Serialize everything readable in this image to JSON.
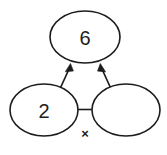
{
  "diagram": {
    "type": "number-bond-multiplication",
    "background_color": "#ffffff",
    "stroke_color": "#1c1c1c",
    "nodes": [
      {
        "id": "product",
        "role": "product",
        "label": "6",
        "filled": true
      },
      {
        "id": "factor-left",
        "role": "factor",
        "label": "2",
        "filled": true
      },
      {
        "id": "factor-right",
        "role": "factor",
        "label": "",
        "filled": false
      }
    ],
    "operator": {
      "symbol": "×",
      "name": "multiplication-sign"
    },
    "arrows": [
      {
        "id": "arrow-left",
        "from": "factor-left",
        "to": "product"
      },
      {
        "id": "arrow-right",
        "from": "factor-right",
        "to": "product"
      }
    ]
  }
}
